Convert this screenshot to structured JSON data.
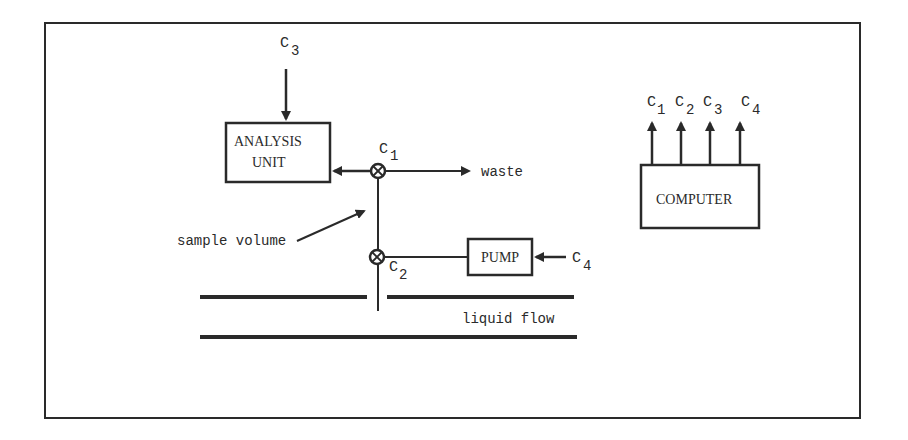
{
  "diagram": {
    "frame": {
      "stroke": "#2a2a2a"
    },
    "analysis_unit": {
      "line1": "ANALYSIS",
      "line2": "UNIT"
    },
    "computer": {
      "label": "COMPUTER"
    },
    "pump": {
      "label": "PUMP"
    },
    "labels": {
      "waste": "waste",
      "sample_volume": "sample volume",
      "liquid_flow": "liquid flow"
    },
    "control_signals": {
      "c3_input": {
        "base": "C",
        "sub": "3"
      },
      "c1_valve": {
        "base": "C",
        "sub": "1"
      },
      "c2_valve": {
        "base": "C",
        "sub": "2"
      },
      "c4_input": {
        "base": "C",
        "sub": "4"
      }
    },
    "computer_outputs": [
      {
        "base": "C",
        "sub": "1"
      },
      {
        "base": "C",
        "sub": "2"
      },
      {
        "base": "C",
        "sub": "3"
      },
      {
        "base": "C",
        "sub": "4"
      }
    ],
    "colors": {
      "ink": "#2a2a2a",
      "background": "#ffffff"
    }
  }
}
